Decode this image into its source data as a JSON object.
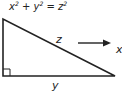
{
  "diagram": {
    "equation": {
      "x": "x",
      "y": "y",
      "z": "z",
      "exp": "2",
      "plus": " + ",
      "equals": " = "
    },
    "labels": {
      "hypotenuse": "z",
      "base": "y",
      "arrow_target": "x"
    },
    "colors": {
      "stroke": "#222222",
      "background": "#ffffff"
    }
  }
}
